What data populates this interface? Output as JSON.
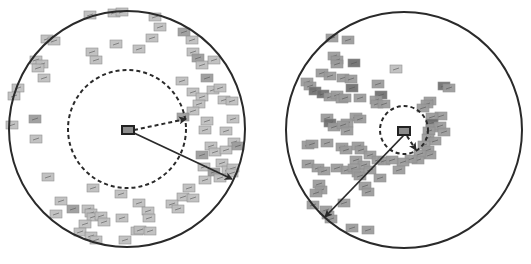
{
  "colors": {
    "background": "#ffffff",
    "outline": "#2a2a2a",
    "thumb_light": "#bdbdbd",
    "thumb_mid": "#9a9a9a",
    "thumb_dark": "#6e6e6e",
    "thumb_border": "#8a8a8a"
  },
  "panels": [
    {
      "id": "left",
      "outer_circle": {
        "cx": 127,
        "cy": 129,
        "r": 118
      },
      "dashed_circle": {
        "cx": 127,
        "cy": 129,
        "r": 59
      },
      "query_box": {
        "x": 122,
        "y": 126,
        "w": 12,
        "h": 8
      },
      "dashed_arrow": {
        "x1": 134,
        "y1": 130,
        "x2": 186,
        "y2": 119
      },
      "solid_arrow": {
        "x1": 134,
        "y1": 133,
        "x2": 232,
        "y2": 179
      },
      "thumbnails": [
        [
          90,
          15,
          "l"
        ],
        [
          114,
          13,
          "l"
        ],
        [
          122,
          12,
          "l"
        ],
        [
          155,
          17,
          "l"
        ],
        [
          160,
          27,
          "l"
        ],
        [
          152,
          38,
          "l"
        ],
        [
          184,
          32,
          "m"
        ],
        [
          192,
          40,
          "l"
        ],
        [
          193,
          52,
          "l"
        ],
        [
          198,
          58,
          "m"
        ],
        [
          202,
          65,
          "l"
        ],
        [
          214,
          60,
          "l"
        ],
        [
          47,
          39,
          "l"
        ],
        [
          54,
          41,
          "l"
        ],
        [
          36,
          60,
          "l"
        ],
        [
          42,
          64,
          "l"
        ],
        [
          38,
          68,
          "l"
        ],
        [
          44,
          78,
          "l"
        ],
        [
          18,
          88,
          "l"
        ],
        [
          14,
          96,
          "l"
        ],
        [
          12,
          125,
          "l"
        ],
        [
          35,
          119,
          "m"
        ],
        [
          36,
          139,
          "l"
        ],
        [
          92,
          52,
          "l"
        ],
        [
          96,
          60,
          "l"
        ],
        [
          116,
          44,
          "l"
        ],
        [
          139,
          49,
          "l"
        ],
        [
          182,
          81,
          "l"
        ],
        [
          207,
          78,
          "m"
        ],
        [
          193,
          92,
          "l"
        ],
        [
          202,
          97,
          "l"
        ],
        [
          213,
          90,
          "l"
        ],
        [
          220,
          88,
          "l"
        ],
        [
          199,
          104,
          "l"
        ],
        [
          224,
          100,
          "l"
        ],
        [
          232,
          101,
          "l"
        ],
        [
          193,
          111,
          "l"
        ],
        [
          183,
          117,
          "m"
        ],
        [
          207,
          121,
          "l"
        ],
        [
          233,
          119,
          "l"
        ],
        [
          205,
          130,
          "l"
        ],
        [
          226,
          131,
          "l"
        ],
        [
          202,
          155,
          "m"
        ],
        [
          211,
          146,
          "l"
        ],
        [
          215,
          152,
          "l"
        ],
        [
          226,
          150,
          "l"
        ],
        [
          234,
          142,
          "l"
        ],
        [
          238,
          146,
          "m"
        ],
        [
          204,
          167,
          "l"
        ],
        [
          214,
          172,
          "m"
        ],
        [
          222,
          163,
          "l"
        ],
        [
          228,
          170,
          "l"
        ],
        [
          233,
          168,
          "l"
        ],
        [
          205,
          180,
          "l"
        ],
        [
          220,
          178,
          "l"
        ],
        [
          232,
          173,
          "l"
        ],
        [
          189,
          188,
          "l"
        ],
        [
          183,
          197,
          "l"
        ],
        [
          193,
          198,
          "l"
        ],
        [
          172,
          204,
          "l"
        ],
        [
          178,
          209,
          "l"
        ],
        [
          48,
          177,
          "l"
        ],
        [
          93,
          188,
          "l"
        ],
        [
          121,
          194,
          "l"
        ],
        [
          139,
          203,
          "l"
        ],
        [
          61,
          201,
          "l"
        ],
        [
          73,
          209,
          "m"
        ],
        [
          56,
          214,
          "l"
        ],
        [
          88,
          209,
          "l"
        ],
        [
          91,
          213,
          "l"
        ],
        [
          93,
          217,
          "l"
        ],
        [
          101,
          216,
          "l"
        ],
        [
          104,
          222,
          "l"
        ],
        [
          85,
          224,
          "l"
        ],
        [
          80,
          232,
          "l"
        ],
        [
          91,
          236,
          "l"
        ],
        [
          96,
          240,
          "l"
        ],
        [
          122,
          218,
          "l"
        ],
        [
          148,
          211,
          "l"
        ],
        [
          149,
          218,
          "l"
        ],
        [
          137,
          231,
          "l"
        ],
        [
          140,
          230,
          "l"
        ],
        [
          150,
          231,
          "l"
        ],
        [
          125,
          240,
          "l"
        ]
      ]
    },
    {
      "id": "right",
      "outer_circle": {
        "cx": 404,
        "cy": 130,
        "r": 118
      },
      "dashed_circle": {
        "cx": 404,
        "cy": 130,
        "r": 24
      },
      "query_box": {
        "x": 398,
        "y": 127,
        "w": 12,
        "h": 8
      },
      "dashed_arrow": {
        "x1": 407,
        "y1": 136,
        "x2": 416,
        "y2": 150
      },
      "solid_arrow": {
        "x1": 404,
        "y1": 135,
        "x2": 325,
        "y2": 217
      },
      "thumbnails": [
        [
          332,
          38,
          "m"
        ],
        [
          348,
          40,
          "m"
        ],
        [
          334,
          56,
          "m"
        ],
        [
          337,
          60,
          "m"
        ],
        [
          337,
          64,
          "m"
        ],
        [
          354,
          63,
          "d"
        ],
        [
          396,
          69,
          "l"
        ],
        [
          322,
          73,
          "m"
        ],
        [
          330,
          76,
          "m"
        ],
        [
          343,
          78,
          "m"
        ],
        [
          351,
          79,
          "m"
        ],
        [
          307,
          82,
          "m"
        ],
        [
          310,
          86,
          "m"
        ],
        [
          315,
          91,
          "d"
        ],
        [
          323,
          94,
          "d"
        ],
        [
          330,
          97,
          "m"
        ],
        [
          337,
          95,
          "m"
        ],
        [
          342,
          99,
          "m"
        ],
        [
          345,
          98,
          "m"
        ],
        [
          352,
          88,
          "d"
        ],
        [
          378,
          84,
          "m"
        ],
        [
          381,
          95,
          "d"
        ],
        [
          376,
          100,
          "m"
        ],
        [
          377,
          104,
          "m"
        ],
        [
          384,
          104,
          "m"
        ],
        [
          360,
          98,
          "m"
        ],
        [
          356,
          117,
          "m"
        ],
        [
          360,
          119,
          "m"
        ],
        [
          327,
          118,
          "m"
        ],
        [
          330,
          123,
          "d"
        ],
        [
          334,
          127,
          "m"
        ],
        [
          347,
          123,
          "m"
        ],
        [
          343,
          125,
          "m"
        ],
        [
          347,
          131,
          "m"
        ],
        [
          308,
          145,
          "m"
        ],
        [
          312,
          144,
          "m"
        ],
        [
          327,
          143,
          "m"
        ],
        [
          342,
          147,
          "m"
        ],
        [
          346,
          150,
          "m"
        ],
        [
          358,
          146,
          "m"
        ],
        [
          361,
          150,
          "m"
        ],
        [
          444,
          86,
          "d"
        ],
        [
          449,
          88,
          "m"
        ],
        [
          430,
          101,
          "m"
        ],
        [
          427,
          104,
          "m"
        ],
        [
          423,
          108,
          "m"
        ],
        [
          441,
          116,
          "m"
        ],
        [
          432,
          117,
          "m"
        ],
        [
          432,
          123,
          "d"
        ],
        [
          432,
          128,
          "m"
        ],
        [
          440,
          126,
          "m"
        ],
        [
          444,
          132,
          "m"
        ],
        [
          429,
          131,
          "m"
        ],
        [
          428,
          138,
          "m"
        ],
        [
          435,
          141,
          "m"
        ],
        [
          424,
          145,
          "m"
        ],
        [
          428,
          150,
          "m"
        ],
        [
          430,
          155,
          "m"
        ],
        [
          420,
          154,
          "m"
        ],
        [
          418,
          160,
          "m"
        ],
        [
          411,
          159,
          "m"
        ],
        [
          403,
          162,
          "m"
        ],
        [
          399,
          170,
          "m"
        ],
        [
          370,
          155,
          "m"
        ],
        [
          378,
          160,
          "m"
        ],
        [
          384,
          161,
          "m"
        ],
        [
          392,
          160,
          "m"
        ],
        [
          356,
          160,
          "m"
        ],
        [
          364,
          165,
          "m"
        ],
        [
          308,
          164,
          "m"
        ],
        [
          318,
          168,
          "m"
        ],
        [
          324,
          171,
          "m"
        ],
        [
          337,
          168,
          "m"
        ],
        [
          347,
          170,
          "m"
        ],
        [
          354,
          168,
          "m"
        ],
        [
          358,
          173,
          "m"
        ],
        [
          360,
          176,
          "m"
        ],
        [
          370,
          170,
          "m"
        ],
        [
          380,
          178,
          "m"
        ],
        [
          319,
          184,
          "m"
        ],
        [
          321,
          190,
          "m"
        ],
        [
          316,
          193,
          "m"
        ],
        [
          313,
          205,
          "m"
        ],
        [
          326,
          210,
          "m"
        ],
        [
          328,
          215,
          "m"
        ],
        [
          331,
          219,
          "m"
        ],
        [
          365,
          186,
          "m"
        ],
        [
          368,
          192,
          "m"
        ],
        [
          344,
          203,
          "m"
        ],
        [
          352,
          228,
          "m"
        ],
        [
          368,
          230,
          "m"
        ]
      ]
    }
  ]
}
